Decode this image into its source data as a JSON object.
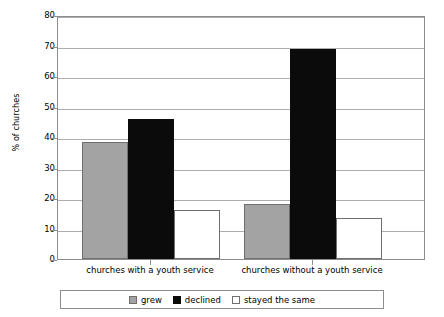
{
  "chart_data": {
    "type": "bar",
    "title": "",
    "xlabel": "",
    "ylabel": "% of churches",
    "ylim": [
      0,
      80
    ],
    "yticks": [
      0,
      10,
      20,
      30,
      40,
      50,
      60,
      70,
      80
    ],
    "ytick_labels": [
      "0",
      "10",
      "20",
      "30",
      "40",
      "50",
      "60",
      "70",
      "80"
    ],
    "grid": true,
    "legend_position": "bottom",
    "categories": [
      "churches with a youth service",
      "churches without a youth service"
    ],
    "series": [
      {
        "name": "grew",
        "color": "#a3a3a3",
        "values": [
          38.5,
          18
        ]
      },
      {
        "name": "declined",
        "color": "#0b0b0b",
        "values": [
          46,
          69
        ]
      },
      {
        "name": "stayed the same",
        "color": "#ffffff",
        "values": [
          16,
          13.5
        ]
      }
    ]
  },
  "legend": {
    "items": [
      {
        "label": "grew",
        "swatch": "grew"
      },
      {
        "label": "declined",
        "swatch": "declined"
      },
      {
        "label": "stayed the same",
        "swatch": "same"
      }
    ]
  },
  "colors": {
    "grew": "#a3a3a3",
    "declined": "#0b0b0b",
    "stayed_the_same": "#ffffff",
    "grid": "#adadad",
    "frame": "#8d8d8d"
  }
}
